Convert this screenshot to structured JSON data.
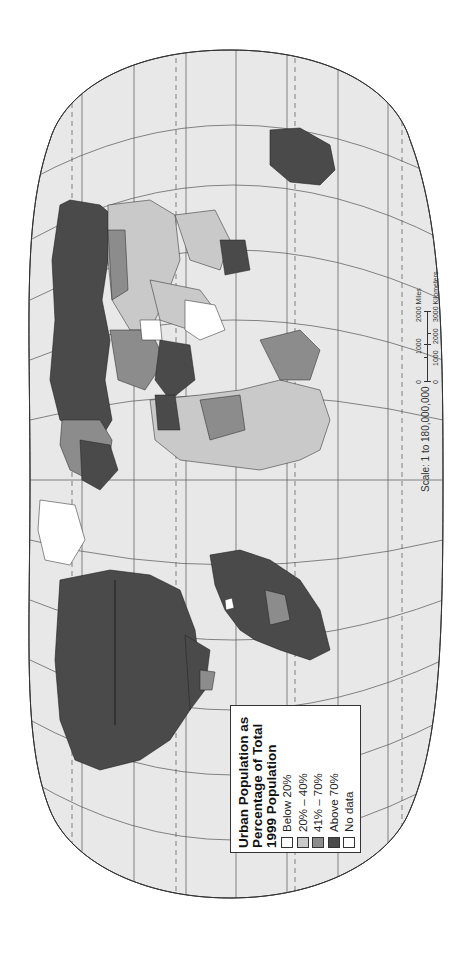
{
  "map": {
    "title_lines": [
      "Urban Population as",
      "Percentage of Total",
      "1999 Population"
    ],
    "orientation": "rotated 90° counter-clockwise (landscape map on portrait page)",
    "projection": "Robinson-style oval world map with graticule",
    "colors": {
      "ocean": "#e8e8e8",
      "graticule": "#555555",
      "border": "#222222",
      "below_20": "#ffffff",
      "20_40": "#c9c9c9",
      "41_70": "#8c8c8c",
      "above_70": "#4a4a4a",
      "no_data": "#ffffff"
    }
  },
  "legend": {
    "title": "Urban Population as Percentage of Total 1999 Population",
    "title_line1": "Urban Population as",
    "title_line2": "Percentage of Total",
    "title_line3": "1999 Population",
    "items": [
      {
        "label": "Below 20%",
        "color": "#ffffff"
      },
      {
        "label": "20% – 40%",
        "color": "#c9c9c9"
      },
      {
        "label": "41% – 70%",
        "color": "#8c8c8c"
      },
      {
        "label": "Above 70%",
        "color": "#4a4a4a"
      },
      {
        "label": "No data",
        "color": "#ffffff"
      }
    ]
  },
  "scale": {
    "text": "Scale:  1 to 180,000,000",
    "miles_labels": [
      "0",
      "1000",
      "2000 Miles"
    ],
    "km_labels": [
      "0",
      "1000",
      "2000",
      "3000 Kilometers"
    ]
  }
}
